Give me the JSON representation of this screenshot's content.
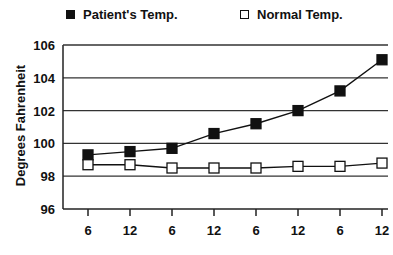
{
  "chart_data": {
    "type": "line",
    "title": "",
    "xlabel": "",
    "ylabel": "Degrees Fahrenheit",
    "ylim": [
      96,
      106
    ],
    "yticks": [
      96,
      98,
      100,
      102,
      104,
      106
    ],
    "grid": "horizontal",
    "legend_position": "top",
    "categories": [
      "6",
      "12",
      "6",
      "12",
      "6",
      "12",
      "6",
      "12"
    ],
    "series": [
      {
        "name": "Patient's Temp.",
        "marker": "filled-square",
        "values": [
          99.3,
          99.5,
          99.7,
          100.6,
          101.2,
          102.0,
          103.2,
          105.1
        ]
      },
      {
        "name": "Normal Temp.",
        "marker": "open-square",
        "values": [
          98.7,
          98.7,
          98.5,
          98.5,
          98.5,
          98.6,
          98.6,
          98.8
        ]
      }
    ]
  },
  "legend": {
    "patient_label": "Patient's Temp.",
    "normal_label": "Normal Temp."
  },
  "axis": {
    "ylabel": "Degrees Fahrenheit"
  }
}
